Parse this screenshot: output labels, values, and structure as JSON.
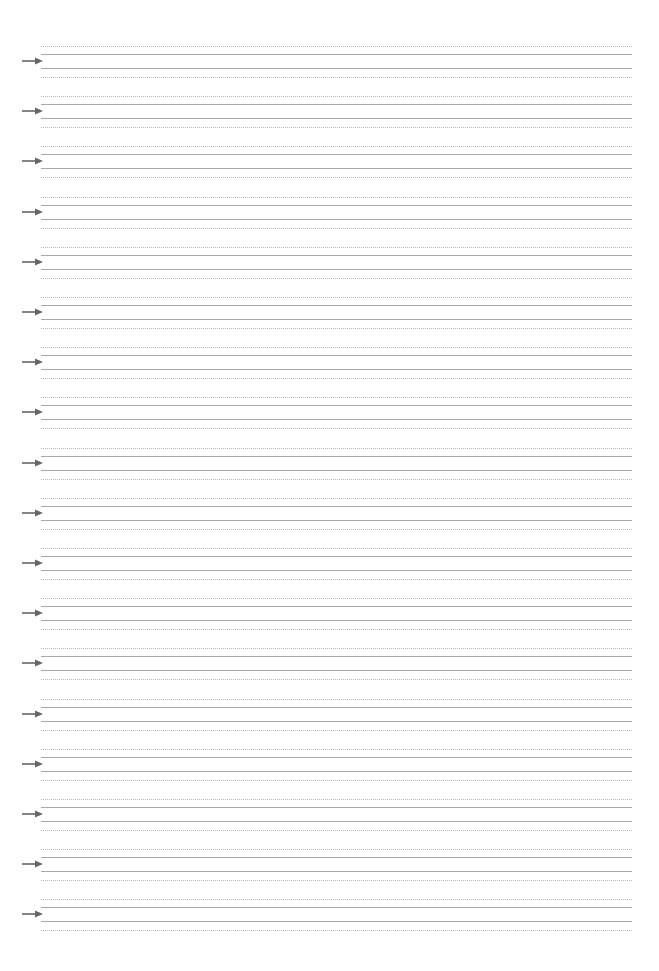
{
  "sheet": {
    "type": "handwriting-practice",
    "group_count": 18,
    "first_arrow_y": 61,
    "group_spacing": 50.2,
    "line_left": 41,
    "line_right": 632,
    "offsets": {
      "top_dotted": -15,
      "top_solid": -7,
      "bottom_solid": 7,
      "bottom_dotted": 16
    },
    "colors": {
      "dotted": "#b8b8b8",
      "solid": "#a8a8a8",
      "arrow": "#666666"
    },
    "icon": "arrow-right-icon"
  }
}
